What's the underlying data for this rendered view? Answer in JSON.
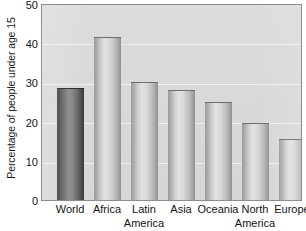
{
  "chart_data": {
    "type": "bar",
    "title": "",
    "subtitle": "",
    "xlabel": "",
    "ylabel": "Percentage of people under age 15",
    "ylim": [
      0,
      50
    ],
    "yticks": [
      50,
      40,
      30,
      20,
      10,
      0
    ],
    "ytick_labels": [
      "50",
      "40",
      "30",
      "20",
      "10",
      "0"
    ],
    "grid": "horizontal",
    "legend": "none",
    "categories": [
      "World",
      "Africa",
      "Latin America",
      "Asia",
      "Oceania",
      "North America",
      "Europe"
    ],
    "category_lines": [
      [
        "World"
      ],
      [
        "Africa"
      ],
      [
        "Latin",
        "America"
      ],
      [
        "Asia"
      ],
      [
        "Oceania"
      ],
      [
        "North",
        "America"
      ],
      [
        "Europe"
      ]
    ],
    "values": [
      28.5,
      41.5,
      30,
      28,
      25,
      19.5,
      15.5
    ],
    "value_unit": "%",
    "highlight_index": 0,
    "series": [
      {
        "name": "Percentage of people under age 15",
        "values": [
          28.5,
          41.5,
          30,
          28,
          25,
          19.5,
          15.5
        ]
      }
    ],
    "colors": {
      "bar_fill": "#d0d0d0",
      "bar_fill_highlight": "#5c5c5c",
      "bar_edge": "#6e6e6e",
      "plot_background": "#d9d9d9",
      "frame": "#8d8d8d",
      "gridline": "#ffffff",
      "text": "#141414"
    }
  }
}
